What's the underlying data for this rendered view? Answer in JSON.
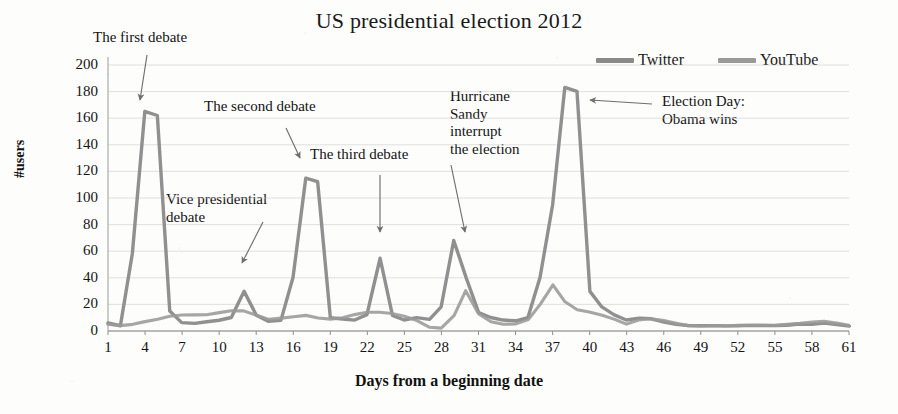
{
  "chart": {
    "title": "US presidential election 2012",
    "x_axis_title": "Days from a beginning date",
    "y_axis_title": "#users"
  },
  "legend": {
    "position": "top-right",
    "items": [
      {
        "label": "Twitter",
        "color": "#8a8a8a",
        "icon": "line-swatch-icon"
      },
      {
        "label": "YouTube",
        "color": "#9a9a9a",
        "icon": "line-swatch-icon"
      }
    ]
  },
  "annotations": [
    {
      "id": "first",
      "text": "The first debate",
      "arrow_to_day": 4,
      "arrow_to_value": 175
    },
    {
      "id": "second",
      "text": "The second debate",
      "arrow_to_day": 17,
      "arrow_to_value": 122
    },
    {
      "id": "third",
      "text": "The third debate",
      "arrow_to_day": 23,
      "arrow_to_value": 62
    },
    {
      "id": "vice",
      "text": "Vice presidential\ndebate",
      "arrow_to_day": 12,
      "arrow_to_value": 40
    },
    {
      "id": "sandy",
      "text": "Hurricane\nSandy\ninterrupt\nthe election",
      "arrow_to_day": 29,
      "arrow_to_value": 75
    },
    {
      "id": "election",
      "text": "Election Day:\nObama wins",
      "arrow_to_day": 38,
      "arrow_to_value": 183
    }
  ],
  "chart_data": {
    "type": "line",
    "title": "US presidential election 2012",
    "xlabel": "Days from a beginning date",
    "ylabel": "#users",
    "xlim": [
      1,
      61
    ],
    "ylim": [
      0,
      200
    ],
    "ytick_labels": [
      "0",
      "20",
      "40",
      "60",
      "80",
      "100",
      "120",
      "140",
      "160",
      "180",
      "200"
    ],
    "yticks": [
      0,
      20,
      40,
      60,
      80,
      100,
      120,
      140,
      160,
      180,
      200
    ],
    "xtick_labels": [
      "1",
      "4",
      "7",
      "10",
      "13",
      "16",
      "19",
      "22",
      "25",
      "28",
      "31",
      "34",
      "37",
      "40",
      "43",
      "46",
      "49",
      "52",
      "55",
      "58",
      "61"
    ],
    "xticks": [
      1,
      4,
      7,
      10,
      13,
      16,
      19,
      22,
      25,
      28,
      31,
      34,
      37,
      40,
      43,
      46,
      49,
      52,
      55,
      58,
      61
    ],
    "grid": "horizontal",
    "legend_position": "top-right",
    "x": [
      1,
      2,
      3,
      4,
      5,
      6,
      7,
      8,
      9,
      10,
      11,
      12,
      13,
      14,
      15,
      16,
      17,
      18,
      19,
      20,
      21,
      22,
      23,
      24,
      25,
      26,
      27,
      28,
      29,
      30,
      31,
      32,
      33,
      34,
      35,
      36,
      37,
      38,
      39,
      40,
      41,
      42,
      43,
      44,
      45,
      46,
      47,
      48,
      49,
      50,
      51,
      52,
      53,
      54,
      55,
      56,
      57,
      58,
      59,
      60,
      61
    ],
    "series": [
      {
        "name": "Twitter",
        "color": "#8a8a8a",
        "values": [
          6,
          4,
          58,
          165,
          162,
          15,
          6,
          6,
          7,
          8,
          10,
          30,
          12,
          7,
          8,
          40,
          115,
          112,
          10,
          9,
          8,
          12,
          55,
          12,
          8,
          10,
          9,
          18,
          68,
          40,
          14,
          10,
          8,
          8,
          10,
          40,
          95,
          183,
          180,
          30,
          18,
          12,
          8,
          10,
          9,
          7,
          5,
          4,
          4,
          4,
          4,
          4,
          4,
          4,
          4,
          4,
          5,
          5,
          6,
          5,
          4
        ]
      },
      {
        "name": "YouTube",
        "color": "#9a9a9a",
        "values": [
          5,
          4,
          5,
          7,
          9,
          11,
          12,
          12,
          12,
          14,
          15,
          15,
          12,
          9,
          10,
          11,
          12,
          10,
          9,
          10,
          12,
          14,
          14,
          13,
          11,
          8,
          3,
          2,
          12,
          30,
          13,
          7,
          5,
          5,
          9,
          20,
          35,
          22,
          16,
          14,
          12,
          9,
          5,
          8,
          9,
          8,
          6,
          4,
          4,
          4,
          4,
          4,
          4,
          4,
          4,
          5,
          6,
          7,
          7,
          6,
          4
        ]
      }
    ],
    "peaks": [
      {
        "day": 4,
        "series": "Twitter",
        "value": 165,
        "event": "The first debate"
      },
      {
        "day": 12,
        "series": "Twitter",
        "value": 30,
        "event": "Vice presidential debate"
      },
      {
        "day": 17,
        "series": "Twitter",
        "value": 115,
        "event": "The second debate"
      },
      {
        "day": 23,
        "series": "Twitter",
        "value": 55,
        "event": "The third debate"
      },
      {
        "day": 29,
        "series": "Twitter",
        "value": 68,
        "event": "Hurricane Sandy interrupt the election"
      },
      {
        "day": 38,
        "series": "Twitter",
        "value": 183,
        "event": "Election Day: Obama wins"
      },
      {
        "day": 37,
        "series": "YouTube",
        "value": 35,
        "event": "Election Day: Obama wins"
      }
    ]
  }
}
